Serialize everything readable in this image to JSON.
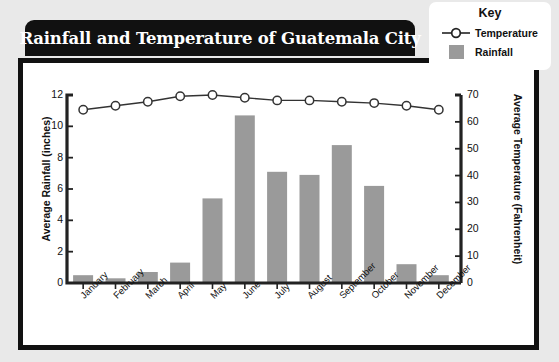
{
  "title": "Rainfall and Temperature of Guatemala City",
  "legend": {
    "heading": "Key",
    "items": [
      {
        "label": "Temperature",
        "marker": "line-circle-marker",
        "color": "#222222"
      },
      {
        "label": "Rainfall",
        "marker": "square-swatch",
        "color": "#9a9a9a"
      }
    ]
  },
  "colors": {
    "bar": "#9a9a9a",
    "line": "#333333",
    "axis": "#222222",
    "banner": "#111111",
    "page_background": "#e9e9e9",
    "panel_background": "#ffffff"
  },
  "chart_data": {
    "type": "bar",
    "title": "Rainfall and Temperature of Guatemala City",
    "xlabel": "",
    "ylabel": "Average Rainfall (inches)",
    "y2label": "Average Temperature (Fahrenheit)",
    "categories": [
      "January",
      "February",
      "March",
      "April",
      "May",
      "June",
      "July",
      "August",
      "September",
      "October",
      "November",
      "December"
    ],
    "ylim": [
      0,
      12
    ],
    "yticks": [
      0,
      2,
      4,
      6,
      8,
      10,
      12
    ],
    "y2lim": [
      0,
      70
    ],
    "y2ticks": [
      0,
      10,
      20,
      30,
      40,
      50,
      60,
      70
    ],
    "grid": false,
    "legend_position": "top-right",
    "series": [
      {
        "name": "Rainfall",
        "type": "bar",
        "axis": "left",
        "unit": "inches",
        "values": [
          0.5,
          0.3,
          0.7,
          1.3,
          5.4,
          10.7,
          7.1,
          6.9,
          8.8,
          6.2,
          1.2,
          0.5
        ]
      },
      {
        "name": "Temperature",
        "type": "line",
        "axis": "right",
        "unit": "Fahrenheit",
        "values": [
          64.5,
          66.0,
          67.5,
          69.5,
          70.0,
          69.0,
          68.0,
          68.0,
          67.5,
          67.0,
          66.0,
          64.5
        ]
      }
    ]
  }
}
